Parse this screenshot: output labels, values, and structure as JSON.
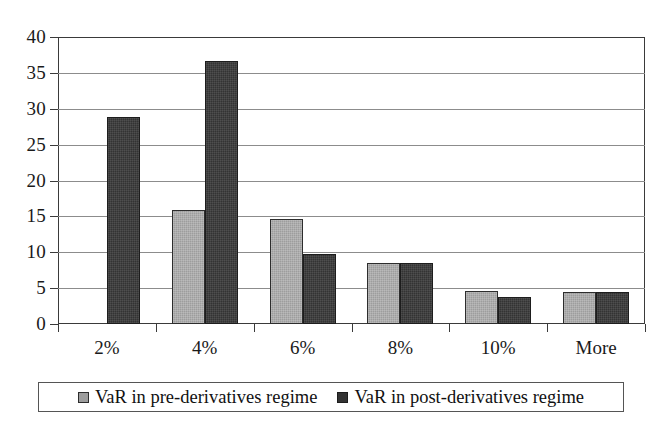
{
  "chart_data": {
    "type": "bar",
    "title": "",
    "subtitle": "",
    "xlabel": "",
    "ylabel": "",
    "categories": [
      "2%",
      "4%",
      "6%",
      "8%",
      "10%",
      "More"
    ],
    "series": [
      {
        "name": "VaR in pre-derivatives regime",
        "color": "#9d9d9d",
        "values": [
          0,
          15.9,
          14.7,
          8.5,
          4.6,
          4.5
        ]
      },
      {
        "name": "VaR in post-derivatives regime",
        "color": "#333333",
        "values": [
          28.8,
          36.7,
          9.7,
          8.5,
          3.7,
          4.5
        ]
      }
    ],
    "ylim": [
      0,
      40
    ],
    "ytick_step": 5,
    "yticks": [
      "40",
      "35",
      "30",
      "25",
      "20",
      "15",
      "10",
      "5",
      "0"
    ],
    "grid": true,
    "legend_position": "bottom"
  },
  "legend": {
    "entries": [
      {
        "label": "VaR in pre-derivatives regime",
        "swatch": "light-gray-swatch"
      },
      {
        "label": "VaR in post-derivatives regime",
        "swatch": "dark-gray-swatch"
      }
    ]
  },
  "colors": {
    "series_pre": "#9d9d9d",
    "series_post": "#333333",
    "gridline": "#8c8c8c",
    "axis": "#3a3a3a",
    "background": "#ffffff"
  }
}
